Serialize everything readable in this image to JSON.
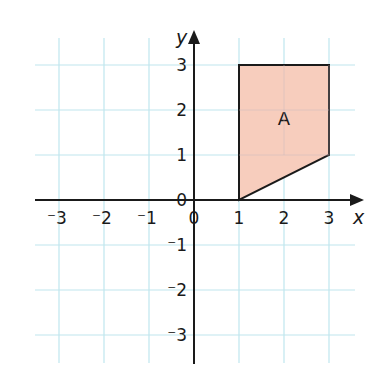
{
  "chart_data": {
    "type": "scatter",
    "title": "",
    "xlabel": "x",
    "ylabel": "y",
    "xlim": [
      -3,
      3
    ],
    "ylim": [
      -3,
      3
    ],
    "grid": true,
    "x_ticks": [
      -3,
      -2,
      -1,
      0,
      1,
      2,
      3
    ],
    "y_ticks": [
      -3,
      -2,
      -1,
      0,
      1,
      2,
      3
    ],
    "x_tick_labels": [
      "⁻3",
      "⁻2",
      "⁻1",
      "0",
      "1",
      "2",
      "3"
    ],
    "y_tick_labels": [
      "⁻3",
      "⁻2",
      "⁻1",
      "0",
      "1",
      "2",
      "3"
    ],
    "shapes": [
      {
        "name": "A",
        "type": "polygon",
        "vertices": [
          [
            1,
            0
          ],
          [
            1,
            3
          ],
          [
            3,
            3
          ],
          [
            3,
            1
          ]
        ],
        "label_position": [
          2,
          1.8
        ],
        "fill": "#f7cdbd",
        "stroke": "#1a1a1a"
      }
    ],
    "colors": {
      "grid": "#bfe6ee",
      "axis": "#1a1a1a",
      "shape_fill": "#f7cdbd"
    }
  }
}
